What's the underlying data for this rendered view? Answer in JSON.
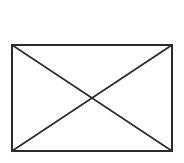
{
  "canvas": {
    "width": 184,
    "height": 163,
    "background_color": "#ffffff"
  },
  "graphic": {
    "name": "crossed-box-placeholder",
    "description": "Rectangle with both diagonals drawn",
    "stroke_color": "#2b2b2b",
    "stroke_width": 2,
    "fill_color": "none",
    "rect": {
      "x": 12,
      "y": 45,
      "width": 160,
      "height": 106
    },
    "corners": {
      "top_left": {
        "x": 12,
        "y": 45
      },
      "top_right": {
        "x": 172,
        "y": 45
      },
      "bottom_right": {
        "x": 172,
        "y": 151
      },
      "bottom_left": {
        "x": 12,
        "y": 151
      }
    },
    "diagonals": [
      {
        "name": "diagonal-tl-br",
        "x1": 12,
        "y1": 45,
        "x2": 172,
        "y2": 151
      },
      {
        "name": "diagonal-tr-bl",
        "x1": 172,
        "y1": 45,
        "x2": 12,
        "y2": 151
      }
    ],
    "center": {
      "x": 92,
      "y": 98
    }
  }
}
